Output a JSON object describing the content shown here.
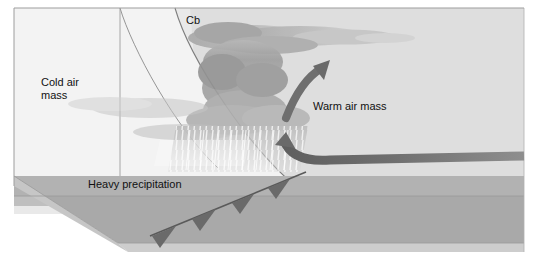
{
  "figure": {
    "width": 538,
    "height": 259
  },
  "labels": {
    "cold_air_mass": "Cold air\nmass",
    "warm_air_mass": "Warm air mass",
    "cumulonimbus": "Cb",
    "heavy_precipitation": "Heavy precipitation"
  },
  "colors": {
    "page_background": "#ffffff",
    "sky_background": "#e8e8e8",
    "cold_air_wedge": "#f2f2f2",
    "warm_air_region": "#dcdcdc",
    "ground_plane": "#a8a8a8",
    "ground_far": "#bdbdbd",
    "ground_slab_edge": "#cfcfcf",
    "cloud_body": "#9a9a9a",
    "cloud_anvil": "#b4b4b4",
    "precipitation_shaft": "#c8c8c8",
    "arrow": "#6e6e6e",
    "front_line": "#555555",
    "outline": "#8c8c8c",
    "text": "#111111"
  },
  "elements": {
    "cold_front_barbs_count": 4,
    "cold_front_barb_direction": "down-left",
    "warm_air_arrow_direction": "curving-up-left",
    "cloud_type": "cumulonimbus-with-anvil",
    "frontal_surface": "curved-boundary-sloping-right"
  }
}
